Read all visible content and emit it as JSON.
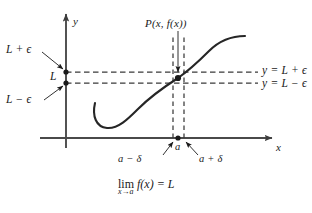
{
  "figure": {
    "type": "epsilon-delta-limit-diagram",
    "caption": {
      "operator": "lim",
      "subscript": "x→a",
      "expression": "f(x) = L"
    },
    "axes": {
      "x_label": "x",
      "y_label": "y",
      "x_axis_y_px": 138,
      "y_axis_x_px": 66
    },
    "labels": {
      "l_plus_eps": "L + ϵ",
      "l_minus_eps": "L − ϵ",
      "l_value": "L",
      "point_p": "P(x, f(x))",
      "a_minus_delta": "a − δ",
      "a_plus_delta": "a + δ",
      "a_point": "a",
      "line_upper": "y = L + ϵ",
      "line_lower": "y = L − ϵ"
    },
    "geometry": {
      "l_plus_eps_y_px": 72,
      "l_minus_eps_y_px": 83,
      "a_minus_delta_x_px": 173,
      "a_plus_delta_x_px": 184,
      "a_x_px": 178,
      "intersection_x_px": 178,
      "intersection_y_px": 78
    },
    "colors": {
      "ink": "#1a1a1a",
      "axis": "#4a4a4a",
      "curve": "#262626",
      "dashed": "#3a3a3a",
      "background": "#ffffff"
    },
    "curve": {
      "description": "valley then rising S-shape crossing band at a",
      "path": "M 95 103 C 92 116, 96 127, 107 128 C 118 129, 127 120, 137 110 C 150 98, 163 87, 178 78 C 192 69, 200 62, 210 52 C 220 43, 232 36, 245 36"
    }
  }
}
